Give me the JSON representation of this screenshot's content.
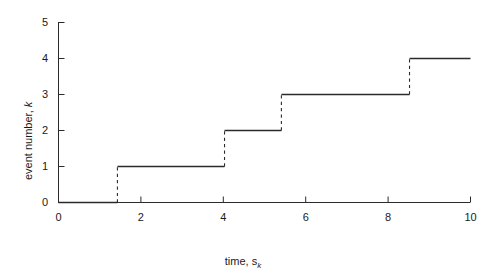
{
  "chart_data": {
    "type": "line",
    "subtype": "step-post",
    "title": "",
    "xlabel_prefix": "time, s",
    "xlabel_sub": "k",
    "ylabel_prefix": "event number, ",
    "ylabel_sub": "k",
    "xlim": [
      0,
      10
    ],
    "ylim": [
      0,
      5
    ],
    "xticks": [
      0,
      2,
      4,
      6,
      8,
      10
    ],
    "xtick_labels": [
      "0",
      "2",
      "4",
      "6",
      "8",
      "10"
    ],
    "yticks": [
      0,
      1,
      2,
      3,
      4,
      5
    ],
    "ytick_labels": [
      "0",
      "1",
      "2",
      "3",
      "4",
      "5"
    ],
    "grid": false,
    "legend": "none",
    "line_color": "#2b2b2b",
    "riser_style": "dashed",
    "axis_color": "#2b2b2b",
    "background": "#ffffff",
    "event_times": [
      1.43,
      4.03,
      5.41,
      8.52
    ],
    "event_numbers": [
      1,
      2,
      3,
      4
    ],
    "steps": [
      {
        "k": 0,
        "t_start": 0.0,
        "t_end": 1.43
      },
      {
        "k": 1,
        "t_start": 1.43,
        "t_end": 4.03
      },
      {
        "k": 2,
        "t_start": 4.03,
        "t_end": 5.41
      },
      {
        "k": 3,
        "t_start": 5.41,
        "t_end": 8.52
      },
      {
        "k": 4,
        "t_start": 8.52,
        "t_end": 10.0
      }
    ]
  }
}
